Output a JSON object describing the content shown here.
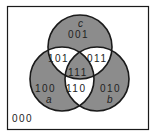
{
  "diagram": {
    "type": "venn-3",
    "sets": [
      {
        "id": "a",
        "label": "a"
      },
      {
        "id": "b",
        "label": "b"
      },
      {
        "id": "c",
        "label": "c"
      }
    ],
    "regions": {
      "r100": "100",
      "r010": "010",
      "r001": "001",
      "r110": "110",
      "r101": "101",
      "r011": "011",
      "r111": "111",
      "r000": "000"
    },
    "colors": {
      "shaded": "#8c8c8c",
      "unshaded": "#ffffff",
      "stroke": "#1a1a1a"
    }
  }
}
